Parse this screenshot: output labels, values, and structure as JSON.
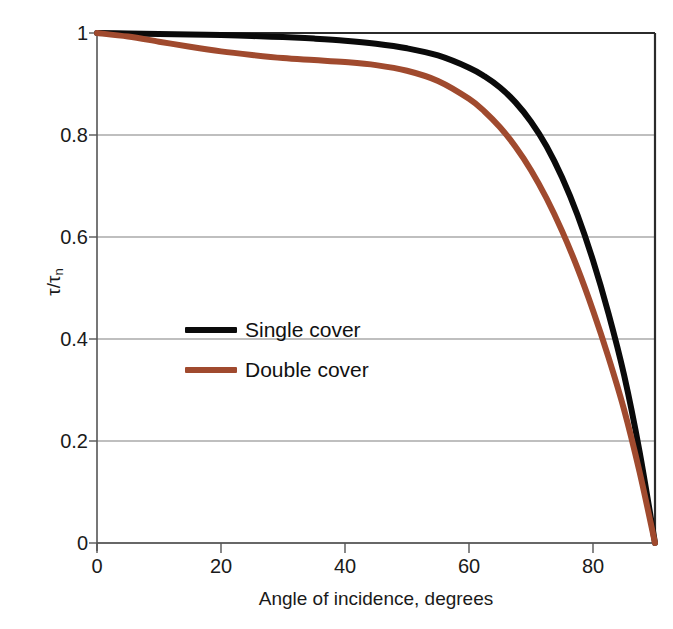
{
  "chart_data": {
    "type": "line",
    "title": "",
    "xlabel": "Angle of incidence, degrees",
    "ylabel": "τ/τ",
    "ylabel_sub": "n",
    "xlim": [
      0,
      90
    ],
    "ylim": [
      0,
      1
    ],
    "xticks": [
      0,
      20,
      40,
      60,
      80
    ],
    "xticklabels": [
      "0",
      "20",
      "40",
      "60",
      "80"
    ],
    "yticks": [
      0,
      0.2,
      0.4,
      0.6,
      0.8,
      1
    ],
    "yticklabels": [
      "0",
      "0.2",
      "0.4",
      "0.6",
      "0.8",
      "1"
    ],
    "grid": "horizontal",
    "grid_color": "#808080",
    "legend_position": "center-left",
    "series": [
      {
        "name": "Single cover",
        "color": "#0a0a0a",
        "linewidth": 6,
        "x": [
          0,
          5,
          10,
          15,
          20,
          25,
          30,
          35,
          40,
          45,
          50,
          55,
          60,
          62.5,
          65,
          67.5,
          70,
          72.5,
          75,
          77.5,
          80,
          82.5,
          85,
          87.5,
          90
        ],
        "y": [
          1.0,
          0.999,
          0.998,
          0.997,
          0.996,
          0.994,
          0.992,
          0.989,
          0.985,
          0.979,
          0.97,
          0.956,
          0.932,
          0.915,
          0.893,
          0.864,
          0.826,
          0.778,
          0.717,
          0.643,
          0.554,
          0.45,
          0.33,
          0.18,
          0.0
        ]
      },
      {
        "name": "Double cover",
        "color": "#a04a2e",
        "linewidth": 6,
        "x": [
          0,
          5,
          10,
          15,
          20,
          25,
          30,
          35,
          40,
          45,
          50,
          55,
          60,
          62.5,
          65,
          67.5,
          70,
          72.5,
          75,
          77.5,
          80,
          82.5,
          85,
          87.5,
          90
        ],
        "y": [
          1.0,
          0.993,
          0.983,
          0.973,
          0.964,
          0.957,
          0.951,
          0.947,
          0.943,
          0.937,
          0.926,
          0.906,
          0.871,
          0.846,
          0.815,
          0.777,
          0.731,
          0.676,
          0.612,
          0.539,
          0.456,
          0.364,
          0.262,
          0.14,
          0.0
        ]
      }
    ]
  },
  "legend": {
    "items": [
      {
        "label": "Single cover",
        "color": "#0a0a0a"
      },
      {
        "label": "Double cover",
        "color": "#a04a2e"
      }
    ]
  },
  "axes": {
    "x_axis_label": "Angle of incidence, degrees",
    "y_axis_label_main": "τ/τ",
    "y_axis_label_sub": "n"
  }
}
